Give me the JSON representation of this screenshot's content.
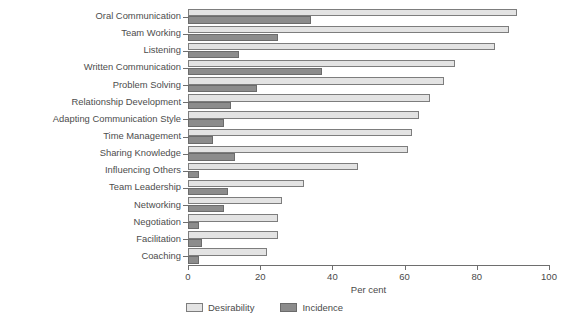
{
  "chart_data": {
    "type": "bar",
    "orientation": "horizontal",
    "title": "",
    "xlabel": "Per cent",
    "ylabel": "",
    "xlim": [
      0,
      100
    ],
    "xticks": [
      0,
      20,
      40,
      60,
      80,
      100
    ],
    "grid": false,
    "legend_position": "bottom-left",
    "categories": [
      "Oral Communication",
      "Team Working",
      "Listening",
      "Written Communication",
      "Problem Solving",
      "Relationship Development",
      "Adapting Communication Style",
      "Time Management",
      "Sharing Knowledge",
      "Influencing Others",
      "Team Leadership",
      "Networking",
      "Negotiation",
      "Facilitation",
      "Coaching"
    ],
    "series": [
      {
        "name": "Desirability",
        "color": "#e3e3e3",
        "values": [
          91,
          89,
          85,
          74,
          71,
          67,
          64,
          62,
          61,
          47,
          32,
          26,
          25,
          25,
          22
        ]
      },
      {
        "name": "Incidence",
        "color": "#8c8c8c",
        "values": [
          34,
          25,
          14,
          37,
          19,
          12,
          10,
          7,
          13,
          3,
          11,
          10,
          3,
          4,
          3
        ]
      }
    ]
  },
  "legend": {
    "items": [
      {
        "label": "Desirability",
        "swatch": "legend-swatch-desirability"
      },
      {
        "label": "Incidence",
        "swatch": "legend-swatch-incidence"
      }
    ]
  },
  "axis": {
    "x_title": "Per cent",
    "tick_labels": [
      "0",
      "20",
      "40",
      "60",
      "80",
      "100"
    ]
  }
}
